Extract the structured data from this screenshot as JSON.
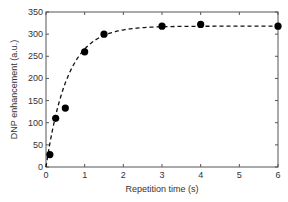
{
  "chart_data": {
    "type": "scatter",
    "title": "",
    "xlabel": "Repetition time (s)",
    "ylabel": "DNP enhancement (a.u.)",
    "xlim": [
      0,
      6
    ],
    "ylim": [
      0,
      350
    ],
    "xticks": [
      0,
      1,
      2,
      3,
      4,
      5,
      6
    ],
    "yticks": [
      0,
      50,
      100,
      150,
      200,
      250,
      300,
      350
    ],
    "grid": false,
    "legend": null,
    "series": [
      {
        "name": "measured",
        "style": "filled-circle",
        "x": [
          0.1,
          0.25,
          0.5,
          1.0,
          1.5,
          3.0,
          4.0,
          6.0
        ],
        "y": [
          28,
          110,
          133,
          260,
          300,
          318,
          322,
          318
        ]
      },
      {
        "name": "fit",
        "style": "dashed-line",
        "model": "A*(1-exp(-t/T))",
        "params": {
          "A": 318,
          "T": 0.55
        }
      }
    ]
  }
}
